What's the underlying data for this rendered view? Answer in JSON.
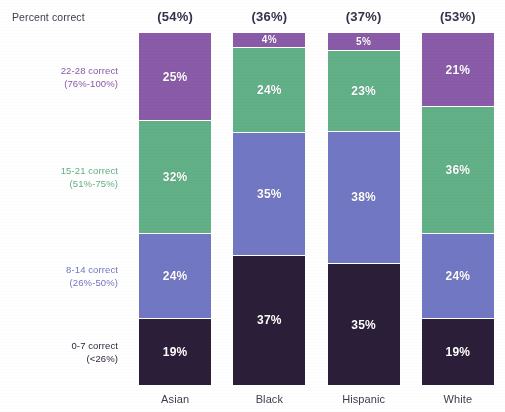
{
  "header": {
    "label": "Percent correct",
    "values": [
      "(54%)",
      "(36%)",
      "(37%)",
      "(53%)"
    ]
  },
  "row_labels": [
    {
      "line1": "22-28 correct",
      "line2": "(76%-100%)",
      "color": "#8A5BA8"
    },
    {
      "line1": "15-21 correct",
      "line2": "(51%-75%)",
      "color": "#62B087"
    },
    {
      "line1": "8-14 correct",
      "line2": "(26%-50%)",
      "color": "#7277C4"
    },
    {
      "line1": "0-7 correct",
      "line2": "(<26%)",
      "color": "#2B1E38"
    }
  ],
  "colors": {
    "band_76_100": "#8A5BA8",
    "band_51_75": "#62B087",
    "band_26_50": "#7277C4",
    "band_under_26": "#2B1E38",
    "text_dark": "#33334a",
    "value_text": "#ffffff",
    "background": "#ffffff"
  },
  "chart_data": {
    "type": "bar",
    "title": "Percent correct",
    "xlabel": "",
    "ylabel": "",
    "ylim": [
      0,
      100
    ],
    "grid": false,
    "legend_position": "left",
    "stacked": true,
    "stack_order": "top-to-bottom",
    "categories": [
      "Asian",
      "Black",
      "Hispanic",
      "White"
    ],
    "category_totals": [
      "(54%)",
      "(36%)",
      "(37%)",
      "(53%)"
    ],
    "series": [
      {
        "name": "22-28 correct (76%-100%)",
        "color": "#8A5BA8",
        "values": [
          25,
          4,
          5,
          21
        ],
        "labels": [
          "25%",
          "4%",
          "5%",
          "21%"
        ]
      },
      {
        "name": "15-21 correct (51%-75%)",
        "color": "#62B087",
        "values": [
          32,
          24,
          23,
          36
        ],
        "labels": [
          "32%",
          "24%",
          "23%",
          "36%"
        ]
      },
      {
        "name": "8-14 correct (26%-50%)",
        "color": "#7277C4",
        "values": [
          24,
          35,
          38,
          24
        ],
        "labels": [
          "24%",
          "35%",
          "38%",
          "24%"
        ]
      },
      {
        "name": "0-7 correct (<26%)",
        "color": "#2B1E38",
        "values": [
          19,
          37,
          35,
          19
        ],
        "labels": [
          "19%",
          "37%",
          "35%",
          "19%"
        ]
      }
    ]
  }
}
